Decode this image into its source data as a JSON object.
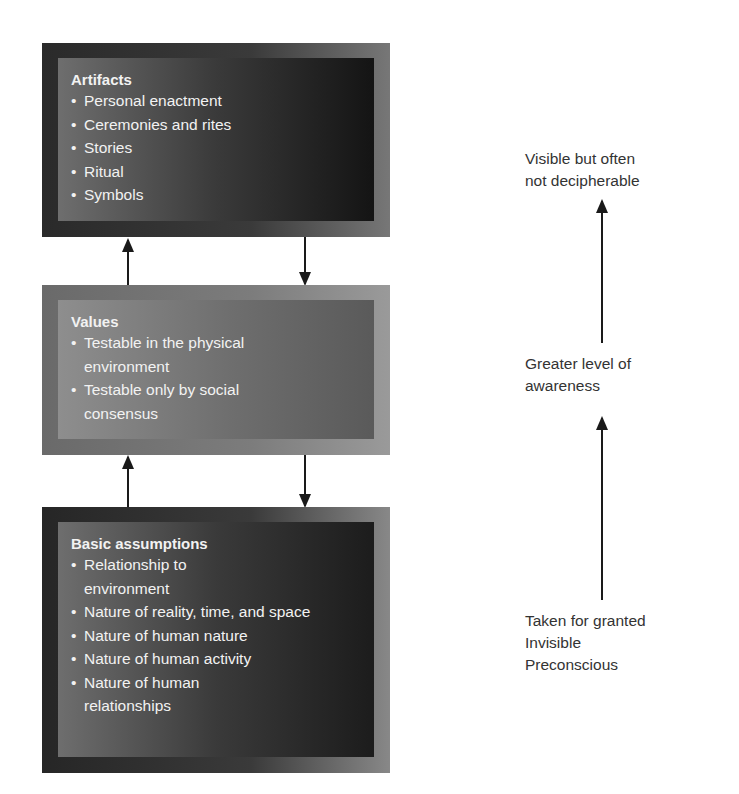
{
  "diagram": {
    "levels": [
      {
        "title": "Artifacts",
        "items": [
          "Personal enactment",
          "Ceremonies and rites",
          "Stories",
          "Ritual",
          "Symbols"
        ]
      },
      {
        "title": "Values",
        "items": [
          "Testable in the physical environment",
          "Testable only by social consensus"
        ]
      },
      {
        "title": "Basic assumptions",
        "items": [
          "Relationship to environment",
          "Nature of reality, time, and space",
          "Nature of human nature",
          "Nature of human activity",
          "Nature of human relationships"
        ]
      }
    ],
    "awareness_scale": {
      "top": [
        "Visible but often",
        "not decipherable"
      ],
      "middle": [
        "Greater level of",
        "awareness"
      ],
      "bottom": [
        "Taken for granted",
        "Invisible",
        "Preconscious"
      ]
    }
  }
}
